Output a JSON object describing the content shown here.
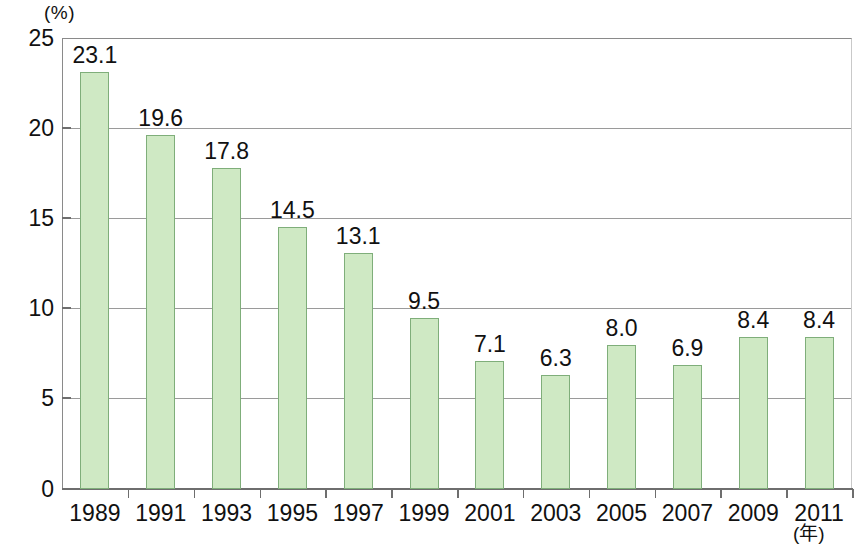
{
  "chart_data": {
    "type": "bar",
    "title": "",
    "subtitle": "",
    "xlabel": "(年)",
    "ylabel": "(%)",
    "categories": [
      "1989",
      "1991",
      "1993",
      "1995",
      "1997",
      "1999",
      "2001",
      "2003",
      "2005",
      "2007",
      "2009",
      "2011"
    ],
    "values": [
      23.1,
      19.6,
      17.8,
      14.5,
      13.1,
      9.5,
      7.1,
      6.3,
      8.0,
      6.9,
      8.4,
      8.4
    ],
    "value_labels": [
      "23.1",
      "19.6",
      "17.8",
      "14.5",
      "13.1",
      "9.5",
      "7.1",
      "6.3",
      "8.0",
      "6.9",
      "8.4",
      "8.4"
    ],
    "ylim": [
      0,
      25
    ],
    "yticks": [
      0,
      5,
      10,
      15,
      20,
      25
    ],
    "ytick_labels": [
      "0",
      "5",
      "10",
      "15",
      "20",
      "25"
    ],
    "grid": true,
    "gridlines_at": [
      5,
      10,
      15,
      20,
      25
    ],
    "legend": null,
    "legend_position": "none",
    "bar_fill_color": "#cfe9c4",
    "bar_border_color": "#7fae7a",
    "grid_color": "#9a9a9a",
    "axis_color": "#6e6e6e",
    "text_color": "#111111",
    "background_color": "#ffffff"
  },
  "axes": {
    "y_unit": "(%)",
    "x_unit": "(年)"
  }
}
